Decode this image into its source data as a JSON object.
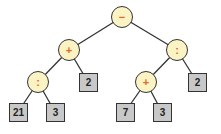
{
  "diagram": {
    "type": "expression-tree",
    "colors": {
      "operator_fill": "#fcf3c4",
      "operator_text": "#e06a2a",
      "leaf_fill": "#c8c8c8",
      "stroke": "#333333"
    },
    "nodes": {
      "root": {
        "label": "−",
        "x": 122,
        "y": 17
      },
      "plus_left": {
        "label": "+",
        "x": 69,
        "y": 50
      },
      "div_right": {
        "label": ":",
        "x": 177,
        "y": 50
      },
      "div_left": {
        "label": ":",
        "x": 38,
        "y": 82
      },
      "leaf_2_left": {
        "label": "2",
        "x": 88,
        "y": 82
      },
      "plus_right": {
        "label": "+",
        "x": 146,
        "y": 82
      },
      "leaf_2_right": {
        "label": "2",
        "x": 197,
        "y": 82
      },
      "leaf_21": {
        "label": "21",
        "x": 18,
        "y": 112
      },
      "leaf_3_left": {
        "label": "3",
        "x": 55,
        "y": 112
      },
      "leaf_7": {
        "label": "7",
        "x": 125,
        "y": 112
      },
      "leaf_3_right": {
        "label": "3",
        "x": 162,
        "y": 112
      }
    }
  }
}
